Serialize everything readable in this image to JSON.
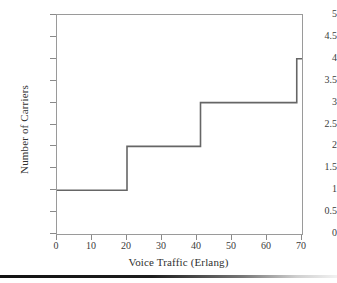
{
  "chart_data": {
    "type": "line",
    "title": "",
    "xlabel": "Voice Traffic (Erlang)",
    "ylabel": "Number of Carriers",
    "xlim": [
      0,
      70
    ],
    "ylim": [
      0,
      5
    ],
    "grid": false,
    "legend": null,
    "step_style": "post",
    "xticks": [
      "0",
      "10",
      "20",
      "30",
      "40",
      "50",
      "60",
      "70"
    ],
    "xtick_values": [
      0,
      10,
      20,
      30,
      40,
      50,
      60,
      70
    ],
    "yticks": [
      "0",
      "0.5",
      "1",
      "1.5",
      "2",
      "2.5",
      "3",
      "3.5",
      "4",
      "4.5",
      "5"
    ],
    "ytick_values": [
      0,
      0.5,
      1,
      1.5,
      2,
      2.5,
      3,
      3.5,
      4,
      4.5,
      5
    ],
    "series": [
      {
        "name": "Number of Carriers",
        "color": "#666666",
        "x": [
          0,
          20,
          20,
          41,
          41,
          68.5,
          68.5,
          70
        ],
        "y": [
          1,
          1,
          2,
          2,
          3,
          3,
          4,
          4
        ],
        "steps": [
          {
            "x_start": 0,
            "x_end": 20,
            "carriers": 1
          },
          {
            "x_start": 20,
            "x_end": 41,
            "carriers": 2
          },
          {
            "x_start": 41,
            "x_end": 68.5,
            "carriers": 3
          },
          {
            "x_start": 68.5,
            "x_end": 70,
            "carriers": 4
          }
        ]
      }
    ]
  },
  "figure": {
    "axis_color": "#8a8a8a",
    "line_color": "#666666",
    "text_color": "#3b3b3b",
    "background": "#ffffff"
  }
}
